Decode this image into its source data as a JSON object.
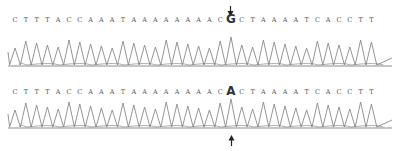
{
  "figure": {
    "panels": [
      {
        "id": "top",
        "sequence": [
          "C",
          "T",
          "T",
          "T",
          "A",
          "C",
          "C",
          "A",
          "A",
          "A",
          "T",
          "A",
          "A",
          "A",
          "A",
          "A",
          "A",
          "A",
          "A",
          "C",
          "G",
          "C",
          "T",
          "A",
          "A",
          "A",
          "A",
          "T",
          "C",
          "A",
          "C",
          "C",
          "T",
          "T"
        ],
        "variant_index": 20,
        "variant_base": "G",
        "arrow": "down"
      },
      {
        "id": "bottom",
        "sequence": [
          "C",
          "T",
          "T",
          "T",
          "A",
          "C",
          "C",
          "A",
          "A",
          "A",
          "T",
          "A",
          "A",
          "A",
          "A",
          "A",
          "A",
          "A",
          "A",
          "C",
          "A",
          "C",
          "T",
          "A",
          "A",
          "A",
          "A",
          "T",
          "C",
          "A",
          "C",
          "C",
          "T",
          "T"
        ],
        "variant_index": 20,
        "variant_base": "A",
        "arrow": "up"
      }
    ],
    "colors": {
      "trace": "#8a8a8a",
      "baseline": "#6f6f6f",
      "letters": "#555555",
      "arrow": "#222222"
    }
  }
}
